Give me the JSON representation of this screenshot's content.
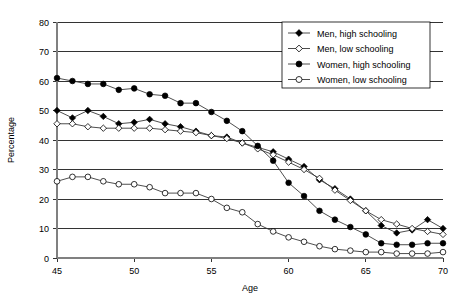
{
  "chart_data": {
    "type": "line",
    "title": "",
    "xlabel": "Age",
    "ylabel": "Percentage",
    "xlim": [
      45,
      70
    ],
    "ylim": [
      0,
      80
    ],
    "xticks": [
      45,
      50,
      55,
      60,
      65,
      70
    ],
    "yticks": [
      0,
      10,
      20,
      30,
      40,
      50,
      60,
      70,
      80
    ],
    "grid": "horizontal",
    "legend_position": "top-right",
    "x": [
      45,
      46,
      47,
      48,
      49,
      50,
      51,
      52,
      53,
      54,
      55,
      56,
      57,
      58,
      59,
      60,
      61,
      62,
      63,
      64,
      65,
      66,
      67,
      68,
      69,
      70
    ],
    "series": [
      {
        "name": "Men, high schooling",
        "marker": "filled-diamond",
        "values": [
          50.0,
          47.5,
          50.0,
          48.0,
          45.5,
          46.0,
          47.0,
          45.5,
          44.5,
          43.0,
          41.5,
          41.0,
          39.0,
          37.5,
          36.0,
          33.5,
          31.0,
          26.5,
          23.5,
          20.0,
          16.0,
          11.0,
          8.5,
          9.5,
          13.0,
          10.0
        ]
      },
      {
        "name": "Men, low schooling",
        "marker": "open-diamond",
        "values": [
          45.5,
          45.5,
          44.5,
          44.0,
          44.0,
          44.0,
          44.0,
          43.5,
          43.0,
          42.5,
          41.5,
          40.5,
          39.0,
          37.0,
          35.0,
          32.5,
          30.0,
          27.0,
          23.0,
          19.5,
          16.0,
          13.0,
          11.5,
          10.0,
          9.0,
          8.0
        ]
      },
      {
        "name": "Women, high schooling",
        "marker": "filled-circle",
        "values": [
          61.0,
          60.0,
          59.0,
          59.0,
          57.0,
          57.5,
          55.5,
          55.0,
          52.5,
          52.5,
          49.5,
          46.5,
          43.0,
          38.0,
          33.0,
          25.5,
          21.0,
          16.0,
          13.0,
          10.5,
          8.0,
          5.0,
          4.5,
          4.5,
          5.0,
          5.0
        ]
      },
      {
        "name": "Women, low schooling",
        "marker": "open-circle",
        "values": [
          26.0,
          27.5,
          27.5,
          26.0,
          25.0,
          25.0,
          24.0,
          22.0,
          22.0,
          22.0,
          20.0,
          17.0,
          15.5,
          11.5,
          9.0,
          7.0,
          5.5,
          4.0,
          3.0,
          2.5,
          2.0,
          2.0,
          1.5,
          1.5,
          1.5,
          2.0
        ]
      }
    ]
  },
  "axes": {
    "x_title": "Age",
    "y_title": "Percentage",
    "x_tick_labels": [
      "45",
      "50",
      "55",
      "60",
      "65",
      "70"
    ],
    "y_tick_labels": [
      "0",
      "10",
      "20",
      "30",
      "40",
      "50",
      "60",
      "70",
      "80"
    ]
  },
  "legend": {
    "items": [
      {
        "label": "Men, high schooling"
      },
      {
        "label": "Men, low schooling"
      },
      {
        "label": "Women, high schooling"
      },
      {
        "label": "Women, low schooling"
      }
    ]
  },
  "colors": {
    "line": "#3a3a3a",
    "marker_fill": "#000000",
    "marker_open": "#ffffff",
    "grid": "#000000",
    "axis": "#808080",
    "background": "#ffffff"
  }
}
